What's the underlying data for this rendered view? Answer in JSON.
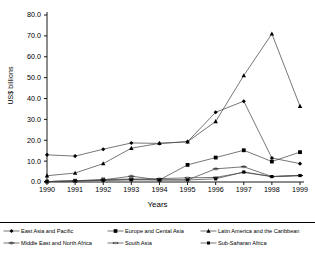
{
  "chart_data": {
    "type": "line",
    "title": "",
    "xlabel": "Years",
    "ylabel": "US$ billions",
    "x": [
      1990,
      1991,
      1992,
      1993,
      1994,
      1995,
      1996,
      1997,
      1998,
      1999
    ],
    "xticklabels": [
      "1990",
      "1991",
      "1992",
      "1993",
      "1994",
      "1995",
      "1996",
      "1997",
      "1998",
      "1999"
    ],
    "yticklabels": [
      "0.0",
      "10.0",
      "20.0",
      "30.0",
      "40.0",
      "50.0",
      "60.0",
      "70.0",
      "80.0"
    ],
    "yticks": [
      0,
      10,
      20,
      30,
      40,
      50,
      60,
      70,
      80
    ],
    "ylim": [
      0,
      80
    ],
    "grid": false,
    "legend_position": "bottom",
    "series": [
      {
        "name": "East Asia and Pacific",
        "marker": "diamond",
        "values": [
          13.0,
          12.4,
          15.7,
          18.7,
          18.5,
          19.3,
          33.4,
          38.7,
          11.5,
          8.8
        ]
      },
      {
        "name": "Europe and Central Asia",
        "marker": "square",
        "values": [
          0.2,
          0.6,
          1.2,
          1.4,
          1.0,
          8.2,
          11.7,
          15.2,
          9.8,
          14.3
        ]
      },
      {
        "name": "Latin America and the Caribbean",
        "marker": "triangle",
        "values": [
          3.0,
          4.3,
          8.8,
          16.2,
          18.5,
          19.3,
          29.0,
          51.0,
          71.0,
          36.3
        ]
      },
      {
        "name": "Middle East and North Africa",
        "marker": "dash-square",
        "values": [
          0.2,
          0.5,
          1.0,
          2.8,
          1.0,
          1.0,
          6.3,
          7.3,
          2.6,
          3.1
        ]
      },
      {
        "name": "South Asia",
        "marker": "dash",
        "values": [
          0.2,
          0.5,
          0.8,
          1.3,
          1.6,
          2.0,
          2.2,
          4.6,
          2.6,
          3.1
        ]
      },
      {
        "name": "Sub-Saharan Africa",
        "marker": "square-small",
        "values": [
          0.2,
          0.5,
          0.8,
          1.0,
          1.0,
          1.0,
          1.5,
          4.8,
          2.6,
          3.1
        ]
      }
    ]
  },
  "legend": {
    "items": [
      {
        "label": "East Asia and Pacific"
      },
      {
        "label": "Europe and Cental Asia"
      },
      {
        "label": "Latin America and the Caribbean"
      },
      {
        "label": "Middle East and North Africa"
      },
      {
        "label": "South Asia"
      },
      {
        "label": "Sub-Saharan Africa"
      }
    ]
  },
  "colors": {
    "line": "#000000",
    "axis": "#000000",
    "background": "#ffffff"
  }
}
